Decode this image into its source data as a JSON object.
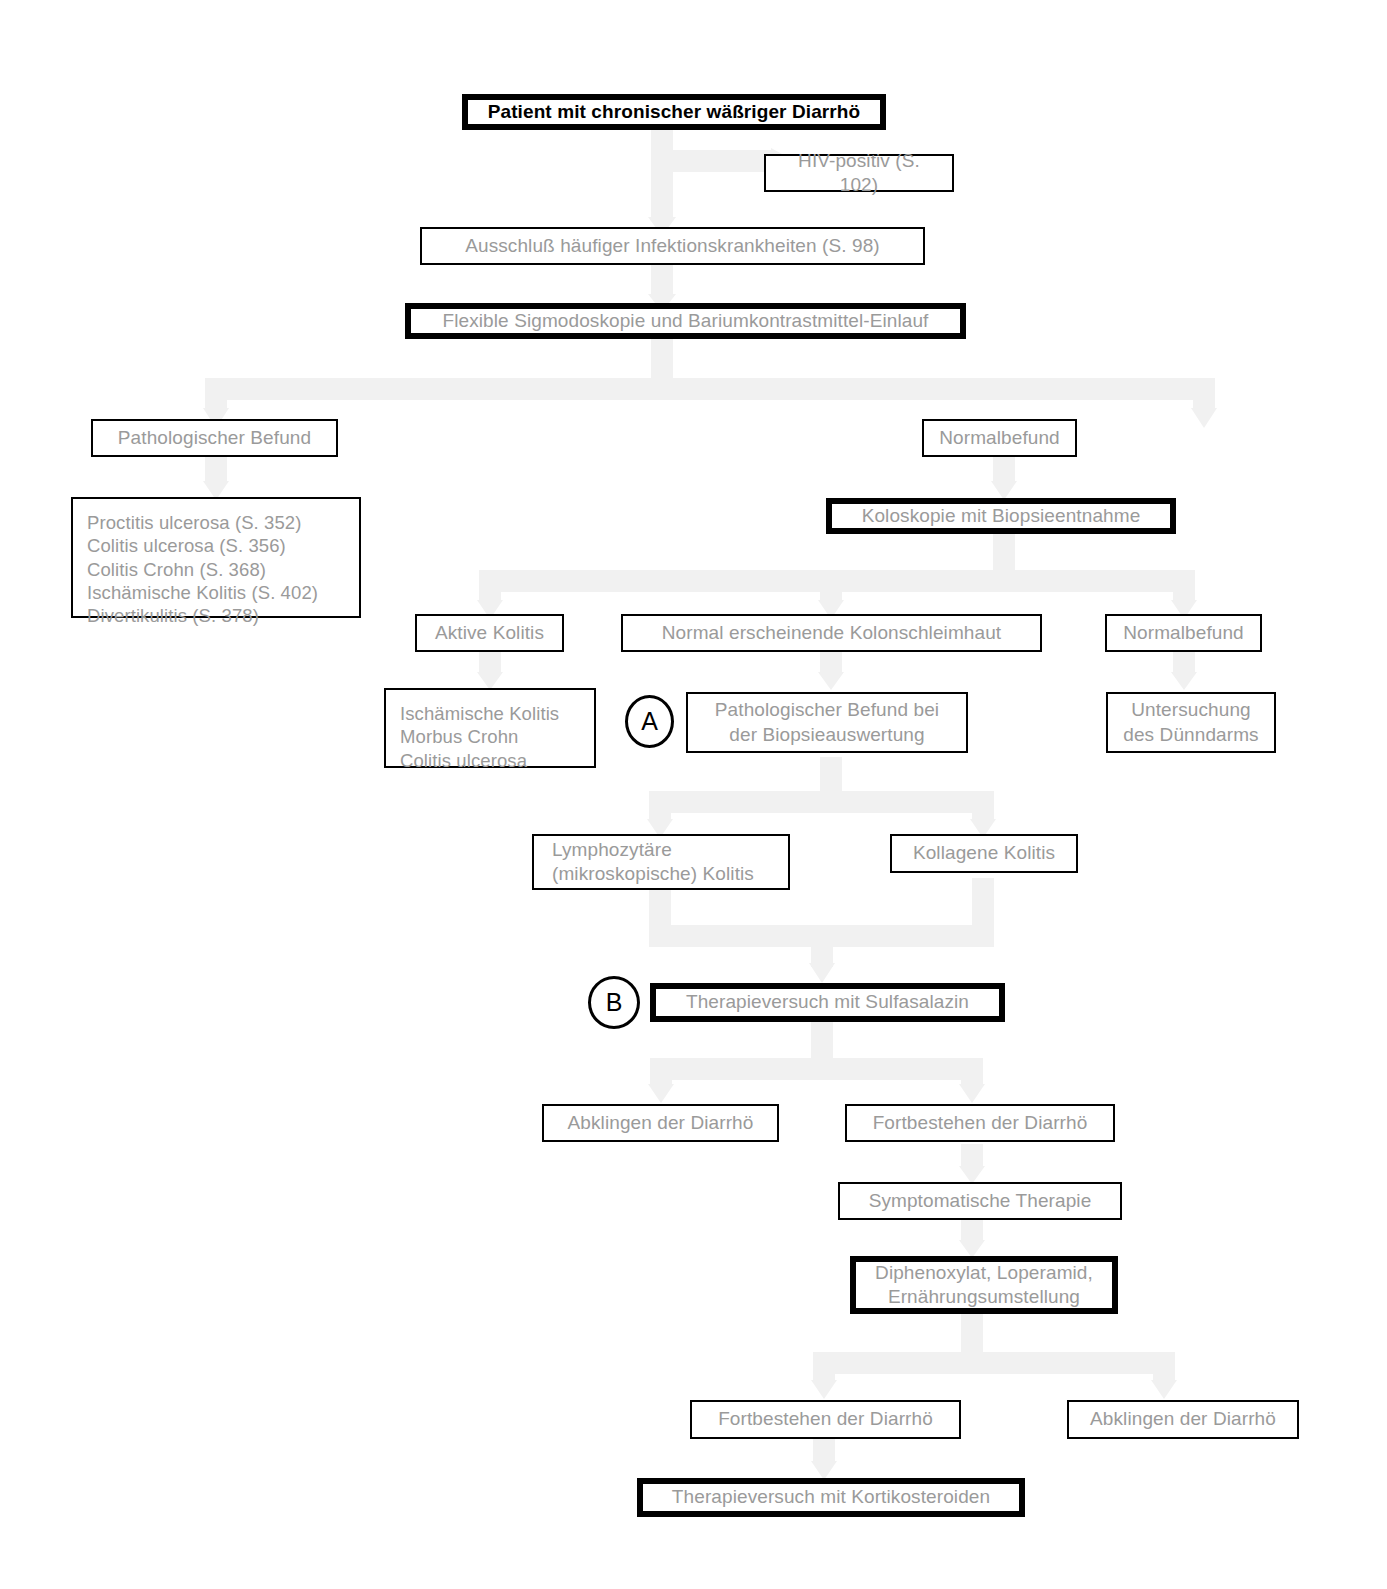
{
  "diagram": {
    "connector_color": "#f1f1f1",
    "box_border_color": "#000000",
    "text_color": "#9a9a9a",
    "emphasis_text_color": "#000000"
  },
  "nodes": {
    "patient": "Patient mit chronischer wäßriger Diarrhö",
    "hiv_positive": "HIV-positiv (S. 102)",
    "ausschluss": "Ausschluß häufiger Infektionskrankheiten (S. 98)",
    "sigmodoskopie": "Flexible Sigmodoskopie und Bariumkontrastmittel-Einlauf",
    "patho_befund": "Pathologischer Befund",
    "normalbefund_1": "Normalbefund",
    "diagnosen_liste": "Proctitis ulcerosa (S. 352)\nColitis ulcerosa (S. 356)\nColitis Crohn (S. 368)\nIschämische Kolitis (S. 402)\nDivertikulitis (S. 378)",
    "koloskopie": "Koloskopie mit Biopsieentnahme",
    "aktive_kolitis": "Aktive Kolitis",
    "normal_kolonschleimhaut": "Normal erscheinende Kolonschleimhaut",
    "normalbefund_2": "Normalbefund",
    "kolitis_liste": "Ischämische Kolitis\nMorbus Crohn\nColitis ulcerosa",
    "patho_biopsie": "Pathologischer Befund bei\nder Biopsieauswertung",
    "untersuchung_duenndarm": "Untersuchung\ndes Dünndarms",
    "lymphozytaere": "Lymphozytäre\n(mikroskopische) Kolitis",
    "kollagene": "Kollagene Kolitis",
    "sulfasalazin": "Therapieversuch mit Sulfasalazin",
    "abklingen_1": "Abklingen der Diarrhö",
    "fortbestehen_1": "Fortbestehen der Diarrhö",
    "symptomatische": "Symptomatische Therapie",
    "diphenoxylat": "Diphenoxylat, Loperamid,\nErnährungsumstellung",
    "fortbestehen_2": "Fortbestehen der Diarrhö",
    "abklingen_2": "Abklingen der Diarrhö",
    "kortikosteroide": "Therapieversuch mit Kortikosteroiden"
  },
  "markers": {
    "a": "A",
    "b": "B"
  }
}
